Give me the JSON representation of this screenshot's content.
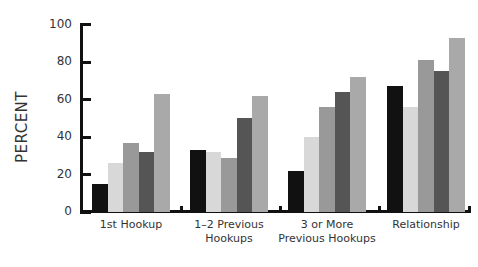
{
  "chart_data": {
    "type": "bar",
    "title": "",
    "xlabel": "",
    "ylabel": "PERCENT",
    "ylim": [
      0,
      100
    ],
    "yticks": [
      0,
      20,
      40,
      60,
      80,
      100
    ],
    "grid": false,
    "legend": null,
    "categories": [
      "1st Hookup",
      "1–2 Previous Hookups",
      "3 or More Previous Hookups",
      "Relationship"
    ],
    "category_lines": [
      [
        "1st Hookup"
      ],
      [
        "1–2 Previous",
        "Hookups"
      ],
      [
        "3 or More",
        "Previous Hookups"
      ],
      [
        "Relationship"
      ]
    ],
    "series": [
      {
        "name": "Series 1",
        "color": "#111111",
        "values": [
          15,
          33,
          22,
          67
        ]
      },
      {
        "name": "Series 2",
        "color": "#d8d8d8",
        "values": [
          26,
          32,
          40,
          56
        ]
      },
      {
        "name": "Series 3",
        "color": "#999999",
        "values": [
          37,
          29,
          56,
          81
        ]
      },
      {
        "name": "Series 4",
        "color": "#555555",
        "values": [
          32,
          50,
          64,
          75
        ]
      },
      {
        "name": "Series 5",
        "color": "#a9a9a9",
        "values": [
          63,
          62,
          72,
          93
        ]
      }
    ]
  }
}
